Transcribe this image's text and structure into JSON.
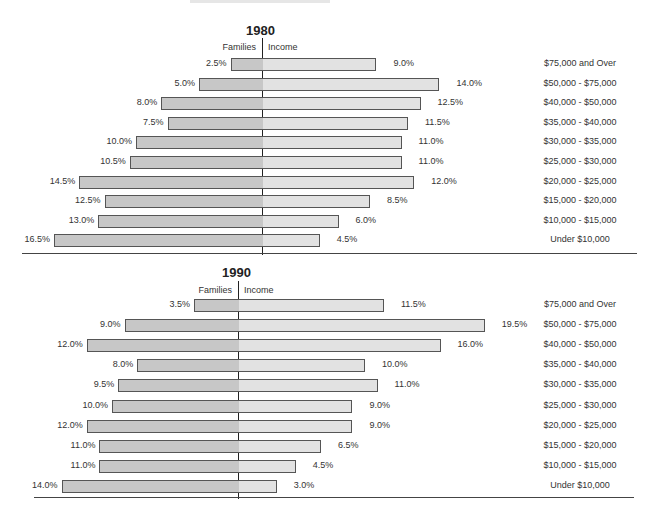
{
  "chart_data": [
    {
      "type": "bar",
      "orientation": "horizontal-butterfly",
      "title": "1980",
      "left_label": "Families",
      "right_label": "Income",
      "categories": [
        "$75,000 and Over",
        "$50,000 - $75,000",
        "$40,000 - $50,000",
        "$35,000 - $40,000",
        "$30,000 - $35,000",
        "$25,000 - $30,000",
        "$20,000 - $25,000",
        "$15,000 - $20,000",
        "$10,000 - $15,000",
        "Under $10,000"
      ],
      "series": [
        {
          "name": "Families",
          "values": [
            2.5,
            5.0,
            8.0,
            7.5,
            10.0,
            10.5,
            14.5,
            12.5,
            13.0,
            16.5
          ]
        },
        {
          "name": "Income",
          "values": [
            9.0,
            14.0,
            12.5,
            11.5,
            11.0,
            11.0,
            12.0,
            8.5,
            6.0,
            4.5
          ]
        }
      ],
      "labels": {
        "Families": [
          "2.5%",
          "5.0%",
          "8.0%",
          "7.5%",
          "10.0%",
          "10.5%",
          "14.5%",
          "12.5%",
          "13.0%",
          "16.5%"
        ],
        "Income": [
          "9.0%",
          "14.0%",
          "12.5%",
          "11.5%",
          "11.0%",
          "11.0%",
          "12.0%",
          "8.5%",
          "6.0%",
          "4.5%"
        ]
      },
      "unit": "%",
      "grid": false
    },
    {
      "type": "bar",
      "orientation": "horizontal-butterfly",
      "title": "1990",
      "left_label": "Families",
      "right_label": "Income",
      "categories": [
        "$75,000 and Over",
        "$50,000 - $75,000",
        "$40,000 - $50,000",
        "$35,000 - $40,000",
        "$30,000 - $35,000",
        "$25,000 - $30,000",
        "$20,000 - $25,000",
        "$15,000 - $20,000",
        "$10,000 - $15,000",
        "Under  $10,000"
      ],
      "series": [
        {
          "name": "Families",
          "values": [
            3.5,
            9.0,
            12.0,
            8.0,
            9.5,
            10.0,
            12.0,
            11.0,
            11.0,
            14.0
          ]
        },
        {
          "name": "Income",
          "values": [
            11.5,
            19.5,
            16.0,
            10.0,
            11.0,
            9.0,
            9.0,
            6.5,
            4.5,
            3.0
          ]
        }
      ],
      "labels": {
        "Families": [
          "3.5%",
          "9.0%",
          "12.0%",
          "8.0%",
          "9.5%",
          "10.0%",
          "12.0%",
          "11.0%",
          "11.0%",
          "14.0%"
        ],
        "Income": [
          "11.5%",
          "19.5%",
          "16.0%",
          "10.0%",
          "11.0%",
          "9.0%",
          "9.0%",
          "6.5%",
          "4.5%",
          "3.0%"
        ]
      },
      "unit": "%",
      "grid": false
    }
  ],
  "colors": {
    "families_bar": "#c7c7c7",
    "income_bar": "#e2e2e2",
    "bar_border": "#555555",
    "axis": "#222222"
  }
}
